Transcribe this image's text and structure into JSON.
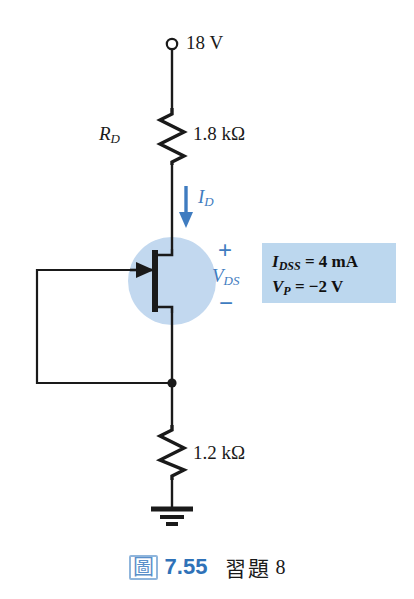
{
  "figure": {
    "kind": "circuit-schematic"
  },
  "circuit": {
    "supply_label": "18 V",
    "supply_terminal_icon": "open-terminal-circle-icon",
    "drain_resistor": {
      "name": "R",
      "subscript": "D",
      "value": "1.8 kΩ"
    },
    "source_resistor": {
      "value": "1.2 kΩ"
    },
    "drain_current": {
      "symbol": "I",
      "subscript": "D",
      "arrow": "down-arrow-icon"
    },
    "drain_source_voltage": {
      "plus": "+",
      "symbol": "V",
      "subscript": "DS",
      "minus": "−"
    },
    "transistor": {
      "type": "n-channel-jfet",
      "icon": "jfet-symbol-icon",
      "highlight_color": "#c2d8ef"
    },
    "ground_icon": "ground-symbol-icon",
    "junction_icon": "junction-dot-icon",
    "wire_color": "#1a1a1a",
    "accent_color": "#3f7cc0"
  },
  "parameters": {
    "background_color": "#bcd7ee",
    "lines": [
      {
        "symbol": "I",
        "subscript": "DSS",
        "equals": "= 4 mA"
      },
      {
        "symbol": "V",
        "subscript": "P",
        "equals": "= −2 V"
      }
    ]
  },
  "caption": {
    "badge": "圖",
    "number": "7.55",
    "text": "習題",
    "problem": "8"
  }
}
